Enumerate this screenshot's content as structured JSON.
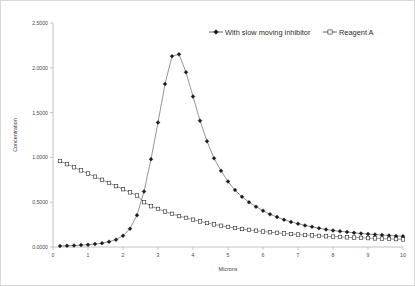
{
  "chart_data": {
    "type": "line",
    "title": "",
    "xlabel": "Microns",
    "ylabel": "Concentration",
    "xlim": [
      0,
      10
    ],
    "ylim": [
      0,
      2.5
    ],
    "grid": false,
    "legend_position": "top-right",
    "x_tick_labels": [
      "0",
      "1",
      "2",
      "3",
      "4",
      "5",
      "6",
      "7",
      "8",
      "9",
      "10"
    ],
    "x_ticks": [
      0,
      1,
      2,
      3,
      4,
      5,
      6,
      7,
      8,
      9,
      10
    ],
    "y_tick_labels": [
      "0.0000",
      "0.5000",
      "1.0000",
      "1.5000",
      "2.0000",
      "2.5000"
    ],
    "y_ticks": [
      0,
      0.5,
      1.0,
      1.5,
      2.0,
      2.5
    ],
    "x": [
      0.2,
      0.4,
      0.6,
      0.8,
      1.0,
      1.2,
      1.4,
      1.6,
      1.8,
      2.0,
      2.2,
      2.4,
      2.6,
      2.8,
      3.0,
      3.2,
      3.4,
      3.6,
      3.8,
      4.0,
      4.2,
      4.4,
      4.6,
      4.8,
      5.0,
      5.2,
      5.4,
      5.6,
      5.8,
      6.0,
      6.2,
      6.4,
      6.6,
      6.8,
      7.0,
      7.2,
      7.4,
      7.6,
      7.8,
      8.0,
      8.2,
      8.4,
      8.6,
      8.8,
      9.0,
      9.2,
      9.4,
      9.6,
      9.8,
      10.0
    ],
    "series": [
      {
        "name": "With slow moving inhibitor",
        "marker": "filled-diamond",
        "color": "#1a1a1a",
        "values": [
          0.012,
          0.014,
          0.017,
          0.021,
          0.026,
          0.033,
          0.043,
          0.058,
          0.082,
          0.125,
          0.205,
          0.355,
          0.62,
          0.98,
          1.39,
          1.82,
          2.13,
          2.15,
          1.95,
          1.68,
          1.41,
          1.18,
          0.99,
          0.85,
          0.73,
          0.635,
          0.56,
          0.5,
          0.45,
          0.405,
          0.365,
          0.335,
          0.305,
          0.28,
          0.26,
          0.24,
          0.225,
          0.21,
          0.195,
          0.185,
          0.175,
          0.167,
          0.158,
          0.151,
          0.145,
          0.139,
          0.133,
          0.128,
          0.124,
          0.12
        ]
      },
      {
        "name": "Reagent A",
        "marker": "open-square",
        "color": "#1a1a1a",
        "values": [
          0.96,
          0.925,
          0.89,
          0.855,
          0.82,
          0.785,
          0.75,
          0.715,
          0.68,
          0.645,
          0.61,
          0.575,
          0.5,
          0.455,
          0.425,
          0.395,
          0.37,
          0.345,
          0.325,
          0.305,
          0.285,
          0.268,
          0.252,
          0.237,
          0.224,
          0.212,
          0.201,
          0.191,
          0.182,
          0.173,
          0.165,
          0.158,
          0.151,
          0.145,
          0.139,
          0.134,
          0.129,
          0.124,
          0.12,
          0.116,
          0.112,
          0.108,
          0.105,
          0.102,
          0.099,
          0.096,
          0.093,
          0.09,
          0.088,
          0.085
        ]
      }
    ]
  },
  "legend": {
    "items": [
      {
        "label": "With slow moving inhibitor"
      },
      {
        "label": "Reagent A"
      }
    ]
  },
  "axes": {
    "x_title": "Microns",
    "y_title": "Concentration"
  }
}
